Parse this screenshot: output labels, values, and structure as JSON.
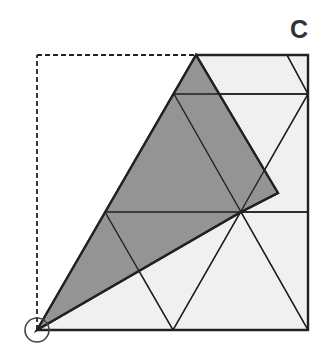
{
  "diagram": {
    "title": "C",
    "colors": {
      "paper": "#f0f0f0",
      "folded": "#8c8c8c",
      "line": "#222222",
      "label": "#333333",
      "background": "#ffffff"
    },
    "outline_square": {
      "x1": 37,
      "y1": 55,
      "x2": 308,
      "y2": 330
    },
    "paper_polygon": [
      [
        196,
        55
      ],
      [
        308,
        55
      ],
      [
        308,
        330
      ],
      [
        37,
        330
      ]
    ],
    "folded_flap": [
      [
        37,
        330
      ],
      [
        196,
        55
      ],
      [
        278,
        193
      ],
      [
        241,
        212
      ]
    ],
    "dashed_edges": [
      [
        [
          37,
          330
        ],
        [
          37,
          55
        ]
      ],
      [
        [
          37,
          55
        ],
        [
          196,
          55
        ]
      ]
    ],
    "crease_lines": [
      [
        [
          174,
          94
        ],
        [
          308,
          94
        ]
      ],
      [
        [
          105,
          212
        ],
        [
          308,
          212
        ]
      ],
      [
        [
          174,
          94
        ],
        [
          241,
          212
        ]
      ],
      [
        [
          105,
          212
        ],
        [
          173,
          330
        ]
      ],
      [
        [
          173,
          330
        ],
        [
          308,
          94
        ]
      ],
      [
        [
          241,
          212
        ],
        [
          308,
          330
        ]
      ],
      [
        [
          287,
          55
        ],
        [
          308,
          94
        ]
      ]
    ],
    "marker_circle": {
      "cx": 37,
      "cy": 330,
      "r": 12
    }
  }
}
